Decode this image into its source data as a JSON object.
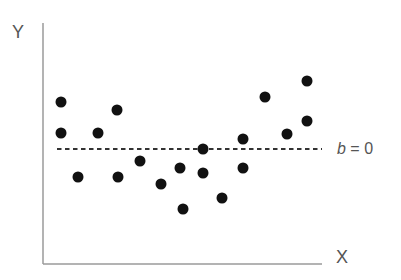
{
  "chart_data": {
    "type": "scatter",
    "title": "",
    "xlabel": "X",
    "ylabel": "Y",
    "grid": false,
    "legend": null,
    "axes_style": "L-shaped (left and bottom axes only), no ticks",
    "pixel_frame": {
      "x_axis_px": [
        43,
        322
      ],
      "y_axis_px": [
        23,
        264
      ]
    },
    "points_px": [
      {
        "x": 61,
        "y": 102
      },
      {
        "x": 61,
        "y": 133
      },
      {
        "x": 78,
        "y": 177
      },
      {
        "x": 98,
        "y": 133
      },
      {
        "x": 117,
        "y": 110
      },
      {
        "x": 118,
        "y": 177
      },
      {
        "x": 140,
        "y": 161
      },
      {
        "x": 161,
        "y": 184
      },
      {
        "x": 180,
        "y": 168
      },
      {
        "x": 183,
        "y": 209
      },
      {
        "x": 203,
        "y": 149
      },
      {
        "x": 203,
        "y": 173
      },
      {
        "x": 222,
        "y": 198
      },
      {
        "x": 243,
        "y": 139
      },
      {
        "x": 243,
        "y": 168
      },
      {
        "x": 265,
        "y": 97
      },
      {
        "x": 287,
        "y": 134
      },
      {
        "x": 307,
        "y": 81
      },
      {
        "x": 307,
        "y": 121
      }
    ],
    "annotations": [
      {
        "type": "horizontal-dashed-line",
        "y_px": 149,
        "x_start_px": 57,
        "x_end_px": 322,
        "label": "b = 0",
        "label_italic_part": "b",
        "label_rest": " = 0"
      }
    ],
    "colors": {
      "points": "#111111",
      "axes": "#9a9a9a",
      "reference_line": "#333333",
      "labels": "#555555"
    }
  },
  "labels": {
    "x_axis": "X",
    "y_axis": "Y",
    "ref_italic": "b",
    "ref_rest": " = 0"
  }
}
